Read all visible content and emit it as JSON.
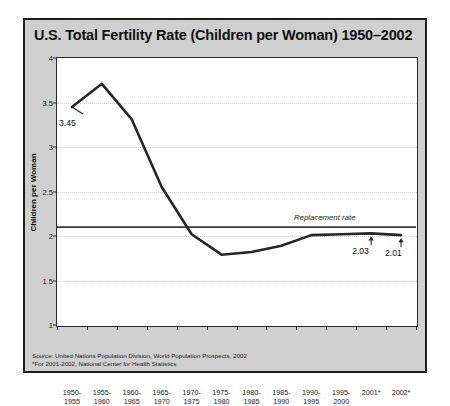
{
  "chart_data": {
    "type": "line",
    "title": "U.S. Total Fertility Rate (Children per Woman) 1950–2002",
    "xlabel": "",
    "ylabel": "Children per Woman",
    "ylim": [
      1,
      4
    ],
    "yticks": [
      "1",
      "1.5",
      "2",
      "2.5",
      "3",
      "3.5",
      "4"
    ],
    "ytick_values": [
      1,
      1.5,
      2,
      2.5,
      3,
      3.5,
      4
    ],
    "grid": "horizontal-dotted",
    "legend": "none",
    "categories": [
      "1950-\n1955",
      "1955-\n1960",
      "1960-\n1965",
      "1965-\n1970",
      "1970-\n1975",
      "1975-\n1980",
      "1980-\n1985",
      "1985-\n1990",
      "1990-\n1995",
      "1995-\n2000",
      "2001*",
      "2002*"
    ],
    "categories_line1": [
      "1950-",
      "1955-",
      "1960-",
      "1965-",
      "1970-",
      "1975-",
      "1980-",
      "1985-",
      "1990-",
      "1995-",
      "2001*",
      "2002*"
    ],
    "categories_line2": [
      "1955",
      "1960",
      "1965",
      "1970",
      "1975",
      "1980",
      "1985",
      "1990",
      "1995",
      "2000",
      "",
      ""
    ],
    "values": [
      3.45,
      3.71,
      3.31,
      2.55,
      2.02,
      1.79,
      1.82,
      1.89,
      2.01,
      2.02,
      2.03,
      2.01
    ],
    "annotations": [
      {
        "name": "first-value",
        "text": "3.45",
        "category": "1950-1955",
        "value": 3.45
      },
      {
        "name": "replacement-rate",
        "text": "Replacement rate",
        "value": 2.1
      },
      {
        "name": "point-2001",
        "text": "2.03",
        "category": "2001*",
        "value": 2.03
      },
      {
        "name": "point-2002",
        "text": "2.01",
        "category": "2002*",
        "value": 2.01
      }
    ],
    "reference_line": {
      "label": "Replacement rate",
      "value": 2.1
    },
    "colors": {
      "line": "#262626",
      "panel_background": "#cfcfcf",
      "plot_background": "#ffffff",
      "border": "#1d1d1d",
      "gridline": "#d2d2d2",
      "text": "#111111"
    }
  },
  "source": {
    "line1": "Source: United Nations Population Division, World Population Prospects, 2002",
    "line2": "*For 2001-2002, National Center for Health Statistics"
  }
}
